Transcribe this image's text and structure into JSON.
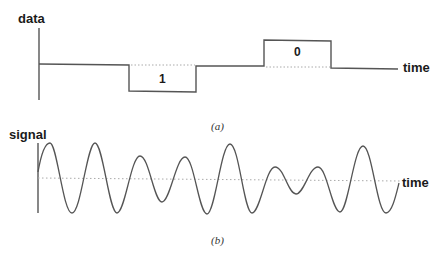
{
  "panel_a": {
    "y_axis_label": "data",
    "x_axis_label": "time",
    "caption": "(a)",
    "bits": [
      {
        "label": "1",
        "level": "low",
        "x_start": 129,
        "x_end": 196
      },
      {
        "label": "0",
        "level": "high",
        "x_start": 264,
        "x_end": 331
      }
    ],
    "line_color": "#555555",
    "dotted_color": "#aaaaaa"
  },
  "panel_b": {
    "y_axis_label": "signal",
    "x_axis_label": "time",
    "caption": "(b)",
    "line_color": "#555555",
    "dotted_color": "#aaaaaa"
  }
}
